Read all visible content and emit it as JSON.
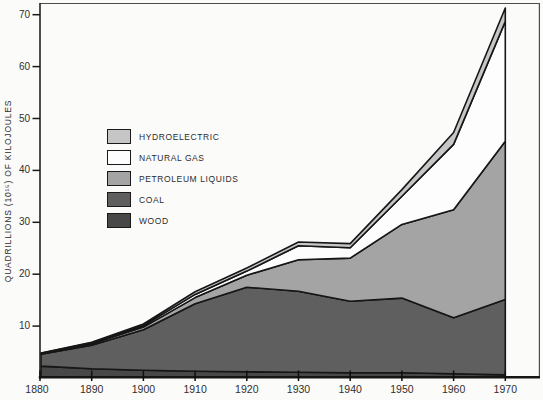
{
  "chart_data": {
    "type": "area",
    "stacked": true,
    "title": "",
    "xlabel": "",
    "ylabel": "QUADRILLIONS (10¹⁵) OF KILOJOULES",
    "categories": [
      1880,
      1890,
      1900,
      1910,
      1920,
      1930,
      1940,
      1950,
      1960,
      1970
    ],
    "series": [
      {
        "name": "WOOD",
        "color": "#484848",
        "values": [
          2.3,
          1.8,
          1.5,
          1.3,
          1.2,
          1.1,
          1.0,
          1.0,
          0.8,
          0.6
        ]
      },
      {
        "name": "COAL",
        "color": "#5f5f5f",
        "values": [
          2.3,
          4.5,
          7.8,
          13.0,
          16.3,
          15.6,
          13.8,
          14.4,
          10.8,
          14.5
        ]
      },
      {
        "name": "PETROLEUM LIQUIDS",
        "color": "#a4a4a4",
        "values": [
          0.1,
          0.3,
          0.5,
          1.2,
          2.3,
          6.1,
          8.3,
          14.2,
          20.8,
          30.5
        ]
      },
      {
        "name": "NATURAL GAS",
        "color": "#fdfdfd",
        "values": [
          0.05,
          0.2,
          0.3,
          0.6,
          0.8,
          2.7,
          2.0,
          5.4,
          12.6,
          23.1
        ]
      },
      {
        "name": "HYDROELECTRIC",
        "color": "#c6c6c6",
        "values": [
          0.05,
          0.1,
          0.3,
          0.5,
          0.6,
          0.7,
          0.8,
          1.3,
          2.3,
          2.6
        ]
      }
    ],
    "totals": [
      4.8,
      6.9,
      10.4,
      16.6,
      21.2,
      26.2,
      25.9,
      36.3,
      47.3,
      71.3
    ],
    "yticks": [
      10,
      20,
      30,
      40,
      50,
      60,
      70
    ],
    "xticks": [
      1880,
      1890,
      1900,
      1910,
      1920,
      1930,
      1940,
      1950,
      1960,
      1970
    ],
    "ylim": [
      0,
      72
    ],
    "xlim": [
      1880,
      1976
    ],
    "grid": false,
    "outline_color": "#161616",
    "legend": {
      "position": "upper-left-inside",
      "order_top_to_bottom": [
        "HYDROELECTRIC",
        "NATURAL GAS",
        "PETROLEUM LIQUIDS",
        "COAL",
        "WOOD"
      ]
    }
  }
}
